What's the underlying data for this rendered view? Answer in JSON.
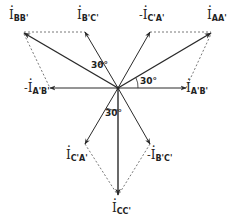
{
  "diagram": {
    "type": "phasor-diagram",
    "origin": [
      118,
      88
    ],
    "line_color": "#2a2a2a",
    "dashed_color": "#555555",
    "phasors": [
      {
        "id": "I_AA'",
        "tip": [
          213,
          32
        ],
        "style": "solid-bold"
      },
      {
        "id": "I_BB'",
        "tip": [
          22,
          32
        ],
        "style": "solid-bold"
      },
      {
        "id": "I_CC'",
        "tip": [
          118,
          196
        ],
        "style": "solid-bold"
      },
      {
        "id": "I_B'C'",
        "tip": [
          85,
          32
        ],
        "style": "solid"
      },
      {
        "id": "-I_C'A'",
        "tip": [
          150,
          32
        ],
        "style": "solid"
      },
      {
        "id": "-I_A'B'",
        "tip": [
          50,
          88
        ],
        "style": "solid"
      },
      {
        "id": "I_A'B'",
        "tip": [
          186,
          88
        ],
        "style": "solid"
      },
      {
        "id": "I_C'A'",
        "tip": [
          85,
          144
        ],
        "style": "solid"
      },
      {
        "id": "-I_B'C'",
        "tip": [
          150,
          144
        ],
        "style": "solid"
      }
    ],
    "construction_lines": [
      {
        "from": [
          22,
          32
        ],
        "to": [
          85,
          32
        ]
      },
      {
        "from": [
          22,
          32
        ],
        "to": [
          50,
          88
        ]
      },
      {
        "from": [
          150,
          32
        ],
        "to": [
          213,
          32
        ]
      },
      {
        "from": [
          186,
          88
        ],
        "to": [
          213,
          32
        ]
      },
      {
        "from": [
          85,
          144
        ],
        "to": [
          118,
          196
        ]
      },
      {
        "from": [
          150,
          144
        ],
        "to": [
          118,
          196
        ]
      }
    ],
    "labels": {
      "i_bb": {
        "main": "I",
        "sub": "BB'",
        "prefix": ""
      },
      "i_bc": {
        "main": "I",
        "sub": "B'C'",
        "prefix": ""
      },
      "neg_i_ca": {
        "main": "I",
        "sub": "C'A'",
        "prefix": "-"
      },
      "i_aa": {
        "main": "I",
        "sub": "AA'",
        "prefix": ""
      },
      "neg_i_ab": {
        "main": "I",
        "sub": "A'B'",
        "prefix": "-"
      },
      "i_ab": {
        "main": "I",
        "sub": "A'B'",
        "prefix": ""
      },
      "i_ca": {
        "main": "I",
        "sub": "C'A'",
        "prefix": ""
      },
      "neg_i_bc": {
        "main": "I",
        "sub": "B'C'",
        "prefix": "-"
      },
      "i_cc": {
        "main": "I",
        "sub": "CC'",
        "prefix": ""
      }
    },
    "angles": {
      "upper_left": "30°",
      "right": "30°",
      "bottom": "30°"
    }
  }
}
